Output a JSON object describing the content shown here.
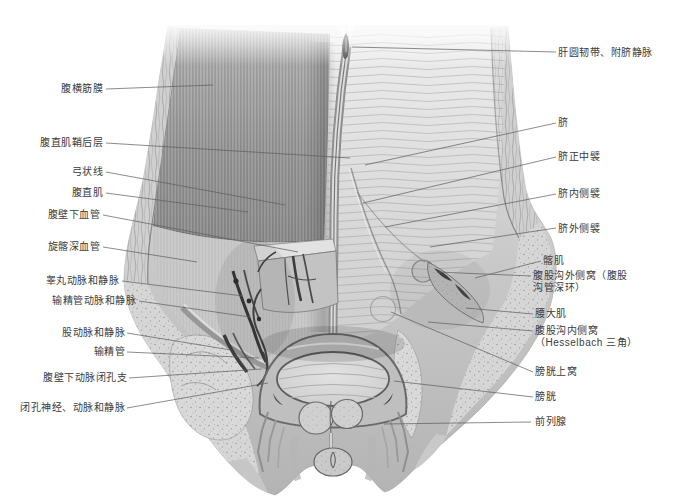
{
  "figure": {
    "background": "#ffffff",
    "label_text_color": "#3b3b3b",
    "leader_line_color": "#5f5f5f",
    "labels_left": [
      {
        "text": "腹横筋膜"
      },
      {
        "text": "腹直肌鞘后层"
      },
      {
        "text": "弓状线"
      },
      {
        "text": "腹直肌"
      },
      {
        "text": "腹壁下血管"
      },
      {
        "text": "旋髂深血管"
      },
      {
        "text": "睾丸动脉和静脉"
      },
      {
        "text": "输精管动脉和静脉"
      },
      {
        "text": "股动脉和静脉"
      },
      {
        "text": "输精管"
      },
      {
        "text": "腹壁下动脉闭孔支"
      },
      {
        "text": "闭孔神经、动脉和静脉"
      }
    ],
    "labels_right": [
      {
        "text": "肝圆韧带、附脐静脉"
      },
      {
        "text": "脐"
      },
      {
        "text": "脐正中襞"
      },
      {
        "text": "脐内侧襞"
      },
      {
        "text": "脐外侧襞"
      },
      {
        "text": "髂肌"
      },
      {
        "text": "腹股沟外侧窝（腹股\n沟管深环）"
      },
      {
        "text": "腰大肌"
      },
      {
        "text": "腹股沟内侧窝\n（Hesselbach 三角）"
      },
      {
        "text": "膀胱上窝"
      },
      {
        "text": "膀胱"
      },
      {
        "text": "前列腺"
      }
    ]
  }
}
